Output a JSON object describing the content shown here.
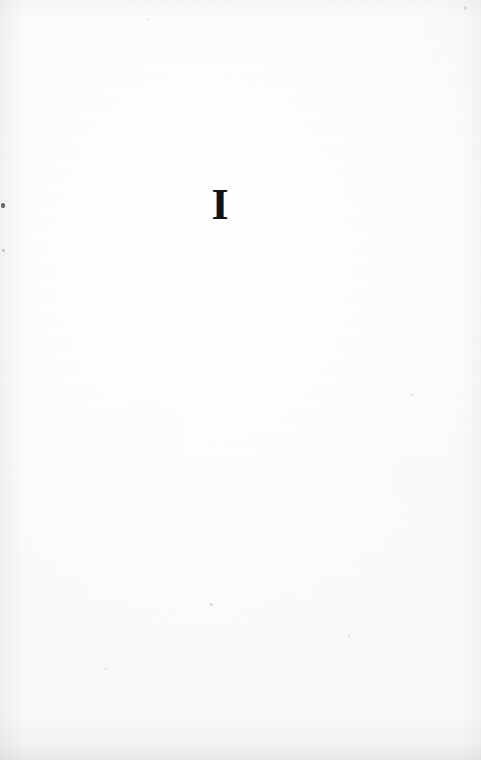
{
  "document": {
    "kind": "scanned-book-page",
    "page_role": "part-title-page",
    "width_px": 481,
    "height_px": 760
  },
  "content": {
    "part_numeral": "I"
  },
  "colors": {
    "paper": "#fdfdfd",
    "ink": "#131313",
    "scan_edge_shadow": "#969696"
  },
  "artifacts": {
    "specks": [
      {
        "name": "left-edge-dark-speck"
      },
      {
        "name": "left-edge-faint-speck"
      },
      {
        "name": "top-right-speck"
      },
      {
        "name": "mid-right-speck"
      },
      {
        "name": "lower-mid-speck"
      },
      {
        "name": "lower-left-speck"
      },
      {
        "name": "lower-right-speck"
      },
      {
        "name": "upper-mid-speck"
      }
    ]
  }
}
